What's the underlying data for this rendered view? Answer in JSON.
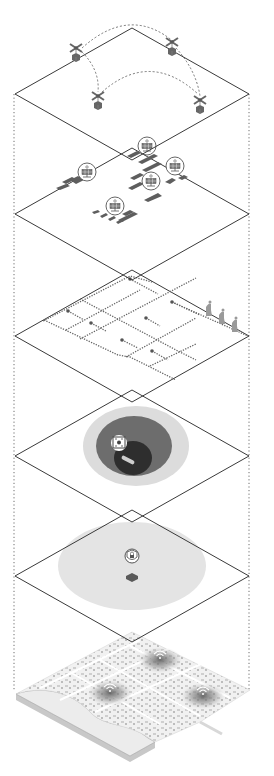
{
  "diagram": {
    "type": "isometric-exploded-layers",
    "colors": {
      "plane_stroke": "#3a3a3a",
      "guide_dots": "#6e6e6e",
      "icon_dark": "#555555",
      "icon_mid": "#7a7a7a",
      "zone_light": "#e2e2e2",
      "zone_mid": "#b5b5b5",
      "zone_dark": "#6d6d6d",
      "zone_core": "#2e2e2e",
      "ground": "#e8e8e8",
      "ground_edge": "#c8c8c8"
    },
    "planes": [
      {
        "id": "drone-delivery-layer",
        "cx": 132,
        "cy": 94
      },
      {
        "id": "solar-energy-layer",
        "cx": 132,
        "cy": 214
      },
      {
        "id": "sensor-network-layer",
        "cx": 132,
        "cy": 336
      },
      {
        "id": "data-hub-coverage-layer",
        "cx": 132,
        "cy": 456
      },
      {
        "id": "security-coverage-layer",
        "cx": 132,
        "cy": 576
      }
    ],
    "plane_half_width": 117,
    "plane_half_height": 66,
    "layers": {
      "drones": {
        "items": [
          {
            "x": 76,
            "y": 48
          },
          {
            "x": 172,
            "y": 42
          },
          {
            "x": 98,
            "y": 96
          },
          {
            "x": 200,
            "y": 100
          }
        ]
      },
      "solar": {
        "icons": [
          {
            "x": 147,
            "y": 146
          },
          {
            "x": 175,
            "y": 166
          },
          {
            "x": 87,
            "y": 172
          },
          {
            "x": 151,
            "y": 181
          },
          {
            "x": 115,
            "y": 206
          }
        ]
      },
      "sensors": {
        "nodes": [
          {
            "x": 130,
            "y": 279
          },
          {
            "x": 68,
            "y": 311
          },
          {
            "x": 91,
            "y": 323
          },
          {
            "x": 172,
            "y": 302
          },
          {
            "x": 146,
            "y": 318
          },
          {
            "x": 122,
            "y": 340
          },
          {
            "x": 152,
            "y": 351
          }
        ],
        "figures": [
          {
            "x": 209,
            "y": 306
          },
          {
            "x": 222,
            "y": 314
          },
          {
            "x": 235,
            "y": 322
          }
        ]
      },
      "data_hub": {
        "cx": 136,
        "cy": 446,
        "icon_label": "data-chip"
      },
      "security": {
        "cx": 132,
        "cy": 566,
        "icon_label": "lock-shield"
      },
      "city_base": {
        "wifi_hotspots": [
          {
            "x": 160,
            "y": 656
          },
          {
            "x": 110,
            "y": 689
          },
          {
            "x": 203,
            "y": 692
          }
        ]
      }
    }
  }
}
